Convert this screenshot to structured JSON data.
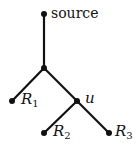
{
  "diagram": {
    "type": "tree",
    "nodes": [
      {
        "id": "source",
        "label": "source",
        "x": 44,
        "y": 14
      },
      {
        "id": "junction",
        "label": "",
        "x": 44,
        "y": 68
      },
      {
        "id": "R1",
        "label": "R",
        "sub": "1",
        "x": 12,
        "y": 101
      },
      {
        "id": "u",
        "label": "u",
        "x": 77,
        "y": 101
      },
      {
        "id": "R2",
        "label": "R",
        "sub": "2",
        "x": 44,
        "y": 133
      },
      {
        "id": "R3",
        "label": "R",
        "sub": "3",
        "x": 109,
        "y": 133
      }
    ],
    "edges": [
      [
        "source",
        "junction"
      ],
      [
        "junction",
        "R1"
      ],
      [
        "junction",
        "u"
      ],
      [
        "u",
        "R2"
      ],
      [
        "u",
        "R3"
      ]
    ],
    "labels": {
      "source": "source",
      "r1": "R",
      "r1_sub": "1",
      "u": "u",
      "r2": "R",
      "r2_sub": "2",
      "r3": "R",
      "r3_sub": "3"
    }
  }
}
